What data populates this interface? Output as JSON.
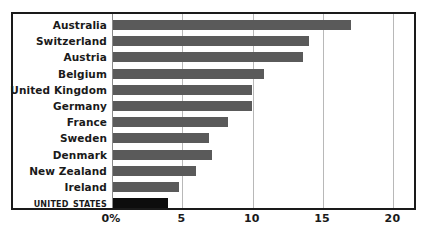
{
  "chart_data": {
    "type": "bar",
    "orientation": "horizontal",
    "title": "",
    "subtitle": "",
    "xlabel": "",
    "ylabel": "",
    "xlim": [
      0,
      21.6
    ],
    "grid": true,
    "legend": null,
    "categories": [
      "Australia",
      "Switzerland",
      "Austria",
      "Belgium",
      "United Kingdom",
      "Germany",
      "France",
      "Sweden",
      "Denmark",
      "New Zealand",
      "Ireland",
      "United States"
    ],
    "values": [
      16.9,
      13.9,
      13.5,
      10.7,
      9.9,
      9.9,
      8.2,
      6.8,
      7.0,
      5.9,
      4.7,
      3.9
    ],
    "tick_labels": [
      "0%",
      "5",
      "10",
      "15",
      "20"
    ],
    "tick_values": [
      0,
      5,
      10,
      15,
      20
    ],
    "highlight_category": "United States",
    "colors": {
      "bar": "#5a5a5a",
      "highlight_bar": "#0d0d0d",
      "gridline": "#b8b8b8",
      "zero_axis": "#8a8a8a",
      "frame": "#1a1a1a",
      "text": "#1a1a1a",
      "background": "#ffffff"
    }
  }
}
